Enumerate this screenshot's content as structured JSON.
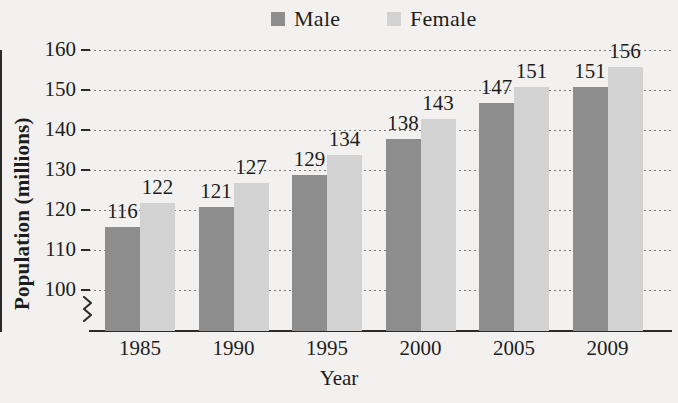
{
  "chart_data": {
    "type": "bar",
    "title": "",
    "xlabel": "Year",
    "ylabel": "Population (millions)",
    "categories": [
      "1985",
      "1990",
      "1995",
      "2000",
      "2005",
      "2009"
    ],
    "series": [
      {
        "name": "Male",
        "color": "#8d8d8d",
        "values": [
          116,
          121,
          129,
          138,
          147,
          151
        ]
      },
      {
        "name": "Female",
        "color": "#d2d2d2",
        "values": [
          122,
          127,
          134,
          143,
          151,
          156
        ]
      }
    ],
    "ylim": [
      90,
      160
    ],
    "yticks": [
      100,
      110,
      120,
      130,
      140,
      150,
      160
    ],
    "ytick_labels": [
      "100",
      "110",
      "120",
      "130",
      "140",
      "150",
      "160"
    ],
    "grid": true,
    "grid_style": "dotted",
    "axis_break": true,
    "legend_position": "top-center",
    "background_color": "#f3f1ef",
    "axis_color": "#2a2a2a",
    "data_labels": [
      [
        "116",
        "122"
      ],
      [
        "121",
        "127"
      ],
      [
        "129",
        "134"
      ],
      [
        "138",
        "143"
      ],
      [
        "147",
        "151"
      ],
      [
        "151",
        "156"
      ]
    ]
  }
}
